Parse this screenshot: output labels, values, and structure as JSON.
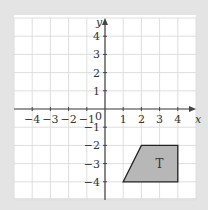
{
  "chart_data": {
    "type": "diagram",
    "title": "",
    "xlabel": "x",
    "ylabel": "y",
    "xlim": [
      -5,
      5
    ],
    "ylim": [
      -5,
      5
    ],
    "grid": true,
    "x_ticks": [
      -4,
      -3,
      -2,
      -1,
      1,
      2,
      3,
      4
    ],
    "y_ticks": [
      4,
      3,
      2,
      1,
      -1,
      -2,
      -3,
      -4
    ],
    "origin_label": "0",
    "shapes": [
      {
        "label": "T",
        "type": "trapezium",
        "vertices": [
          [
            1,
            -4
          ],
          [
            2,
            -2
          ],
          [
            4,
            -2
          ],
          [
            4,
            -4
          ]
        ],
        "fill": "#b7b7b7",
        "stroke": "#222222"
      }
    ]
  },
  "colors": {
    "background": "#e4e4e4",
    "grid_area": "#ffffff",
    "grid_line": "#dedede",
    "axis": "#444444"
  }
}
